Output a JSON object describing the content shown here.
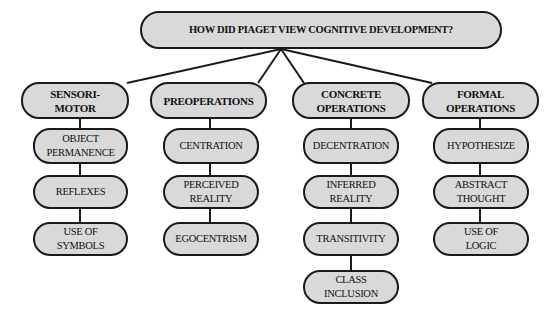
{
  "title": "HOW DID PIAGET VIEW COGNITIVE DEVELOPMENT?",
  "stages": [
    {
      "label": "SENSORI-\nMOTOR",
      "children": [
        "OBJECT\nPERMANENCE",
        "REFLEXES",
        "USE OF\nSYMBOLS"
      ]
    },
    {
      "label": "PREOPERATIONS",
      "children": [
        "CENTRATION",
        "PERCEIVED\nREALITY",
        "EGOCENTRISM"
      ]
    },
    {
      "label": "CONCRETE\nOPERATIONS",
      "children": [
        "DECENTRATION",
        "INFERRED\nREALITY",
        "TRANSITIVITY",
        "CLASS\nINCLUSION"
      ]
    },
    {
      "label": "FORMAL\nOPERATIONS",
      "children": [
        "HYPOTHESIZE",
        "ABSTRACT\nTHOUGHT",
        "USE OF\nLOGIC"
      ]
    }
  ],
  "colors": {
    "node_fill": "#d9d9d9",
    "node_border": "#1a1a1a",
    "text": "#111111",
    "background": "#ffffff"
  }
}
